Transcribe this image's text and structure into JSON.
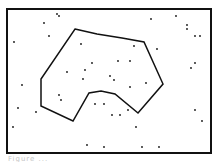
{
  "figure": {
    "frame": {
      "x": 7,
      "y": 9,
      "width": 204,
      "height": 144,
      "stroke": "#111111",
      "stroke_width": 2
    },
    "polygon": {
      "stroke": "#111111",
      "stroke_width": 1.5,
      "points": [
        [
          75,
          29
        ],
        [
          97,
          34
        ],
        [
          122,
          38
        ],
        [
          144,
          42
        ],
        [
          163,
          84
        ],
        [
          138,
          113
        ],
        [
          115,
          94
        ],
        [
          101,
          91
        ],
        [
          89,
          93
        ],
        [
          73,
          121
        ],
        [
          41,
          106
        ],
        [
          41,
          79
        ]
      ]
    },
    "dots": {
      "color": "#111111",
      "radius": 0.9,
      "points": [
        [
          57,
          14
        ],
        [
          59,
          16
        ],
        [
          151,
          19
        ],
        [
          176,
          16
        ],
        [
          44,
          23
        ],
        [
          187,
          25
        ],
        [
          187,
          29
        ],
        [
          14,
          42
        ],
        [
          49,
          36
        ],
        [
          195,
          36
        ],
        [
          200,
          36
        ],
        [
          81,
          44
        ],
        [
          134,
          46
        ],
        [
          157,
          49
        ],
        [
          92,
          63
        ],
        [
          118,
          61
        ],
        [
          130,
          61
        ],
        [
          195,
          63
        ],
        [
          191,
          68
        ],
        [
          67,
          72
        ],
        [
          85,
          70
        ],
        [
          110,
          76
        ],
        [
          83,
          79
        ],
        [
          114,
          80
        ],
        [
          146,
          83
        ],
        [
          22,
          85
        ],
        [
          130,
          87
        ],
        [
          59,
          95
        ],
        [
          61,
          100
        ],
        [
          95,
          104
        ],
        [
          104,
          104
        ],
        [
          18,
          108
        ],
        [
          36,
          112
        ],
        [
          128,
          110
        ],
        [
          112,
          115
        ],
        [
          120,
          115
        ],
        [
          195,
          110
        ],
        [
          202,
          121
        ],
        [
          13,
          127
        ],
        [
          136,
          127
        ],
        [
          87,
          145
        ],
        [
          104,
          147
        ],
        [
          142,
          147
        ],
        [
          159,
          147
        ]
      ]
    }
  },
  "caption": {
    "text": "Figure ..."
  }
}
